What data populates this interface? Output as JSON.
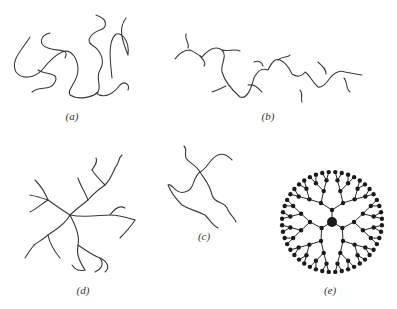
{
  "figure": {
    "panels": [
      {
        "id": "a",
        "label": "(a)",
        "description": "linear polymer chains (random coils)"
      },
      {
        "id": "b",
        "label": "(b)",
        "description": "branched polymer chain"
      },
      {
        "id": "c",
        "label": "(c)",
        "description": "star polymer"
      },
      {
        "id": "d",
        "label": "(d)",
        "description": "hyperbranched polymer"
      },
      {
        "id": "e",
        "label": "(e)",
        "description": "dendrimer"
      }
    ]
  },
  "colors": {
    "line": "#3a3a3a",
    "node": "#1a1a1a",
    "background": "#ffffff"
  }
}
